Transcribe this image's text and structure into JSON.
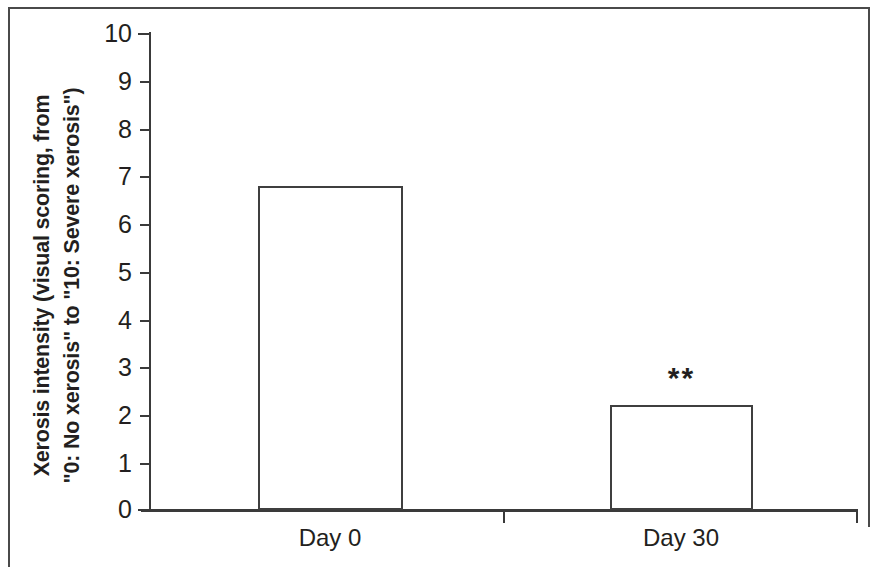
{
  "chart_data": {
    "type": "bar",
    "title": "",
    "subtitle": "",
    "xlabel": "",
    "ylabel": "Xerosis intensity (visual scoring, from \"0: No xerosis\" to \"10: Severe xerosis\")",
    "ylabel_lines": [
      "Xerosis intensity (visual scoring, from",
      "\"0: No xerosis\" to \"10: Severe xerosis\")"
    ],
    "categories": [
      "Day 0",
      "Day 30"
    ],
    "values": [
      6.8,
      2.2
    ],
    "ylim": [
      0,
      10
    ],
    "ytick_labels": [
      "10",
      "9",
      "8",
      "7",
      "6",
      "5",
      "4",
      "3",
      "2",
      "1",
      "0"
    ],
    "ytick_values": [
      10,
      9,
      8,
      7,
      6,
      5,
      4,
      3,
      2,
      1,
      0
    ],
    "grid": false,
    "legend": null,
    "legend_position": "none",
    "bar_fill_color": "#ffffff",
    "bar_edge_color": "#3f3f3f",
    "axis_color": "#3a3a3a",
    "text_color": "#231f20",
    "background_color": "#ffffff",
    "annotations": [
      {
        "text": "**",
        "category": "Day 30",
        "meaning": "significance-marker"
      }
    ]
  },
  "figure": {
    "border_color": "#4a4a4a",
    "width": 879,
    "height": 571
  }
}
